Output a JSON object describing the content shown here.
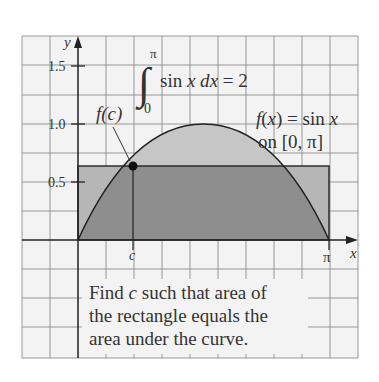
{
  "figure": {
    "axes": {
      "x_label": "x",
      "y_label": "y",
      "y_ticks": [
        {
          "label": "1.5",
          "value": 1.5
        },
        {
          "label": "1.0",
          "value": 1.0
        },
        {
          "label": "0.5",
          "value": 0.5
        }
      ],
      "x_ticks": [
        {
          "label": "c",
          "value": 0.6901
        },
        {
          "label": "π",
          "value": 3.14159
        }
      ]
    },
    "integral": {
      "upper_limit": "π",
      "lower_limit": "0",
      "integrand": "sin x dx = 2"
    },
    "function_label": {
      "line1": "f(x) = sin x",
      "line2": "on [0, π]"
    },
    "point_label": "f(c)",
    "caption": {
      "line1": "Find c such that area of",
      "line2": "the rectangle equals the",
      "line3": "area under the curve."
    },
    "rectangle_height": 0.6366,
    "colors": {
      "background": "#f3f3f3",
      "grid": "#8c8c8c",
      "overlap": "#8e8e8e",
      "curve_only": "#c6c6c6",
      "rect_only": "#b6b6b6",
      "axis": "#222222"
    }
  }
}
